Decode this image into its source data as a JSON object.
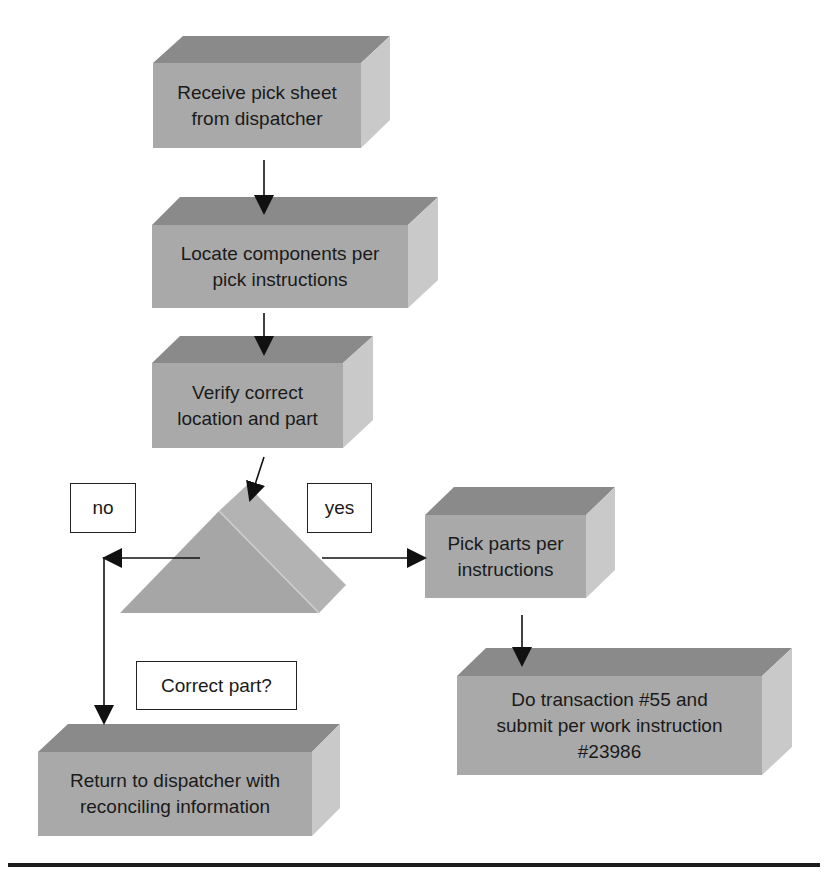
{
  "colors": {
    "box_top": "#8a8a8a",
    "box_front": "#a9a9a9",
    "box_side": "#c9c9c9",
    "arrow": "#111111",
    "border": "#222222"
  },
  "steps": [
    {
      "id": "receive",
      "text": "Receive pick sheet\nfrom dispatcher"
    },
    {
      "id": "locate",
      "text": "Locate components per\npick instructions"
    },
    {
      "id": "verify",
      "text": "Verify correct\nlocation and part"
    },
    {
      "id": "pick",
      "text": "Pick parts per\ninstructions"
    },
    {
      "id": "transaction",
      "text": "Do transaction #55 and\nsubmit per work instruction\n#23986"
    },
    {
      "id": "return",
      "text": "Return to dispatcher with\nreconciling information"
    }
  ],
  "decision": {
    "question": "Correct part?",
    "no_label": "no",
    "yes_label": "yes"
  }
}
